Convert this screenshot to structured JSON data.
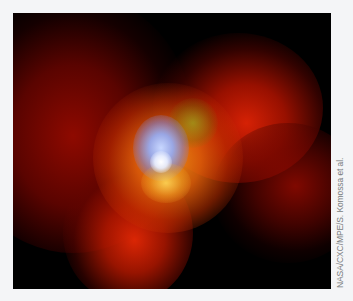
{
  "figure": {
    "image_description": "False-color X-ray astronomical image: bright blue-white core surrounded by orange and red diffuse emission lobes on black background",
    "colors": {
      "background": "#f4f5f7",
      "sky": "#000000",
      "core": "#c8d7ff",
      "halo": "#eb9614",
      "lobes": "#e12305"
    },
    "credit": "NASA/CXC/MPE/S. Komossa et al."
  }
}
